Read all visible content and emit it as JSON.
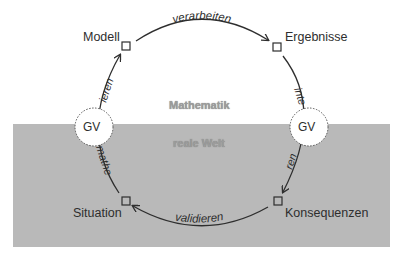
{
  "diagram": {
    "nodes": {
      "modell": "Modell",
      "ergebnisse": "Ergebnisse",
      "situation": "Situation",
      "konsequenzen": "Konsequenzen"
    },
    "edges": {
      "top": "verarbeiten",
      "right": "interpretieren",
      "bottom": "validieren",
      "left": "mathematisieren"
    },
    "edge_visible_fragments": {
      "right_upper": "inte",
      "right_lower": "ren",
      "left_upper": "ieren",
      "left_lower": "mathe"
    },
    "regions": {
      "upper": "Mathematik",
      "lower": "reale Welt"
    },
    "boundary_markers": {
      "left": "GV",
      "right": "GV"
    },
    "colors": {
      "background": "#ffffff",
      "lower_region": "#b9b9b9",
      "stroke": "#2e2e2e"
    }
  }
}
